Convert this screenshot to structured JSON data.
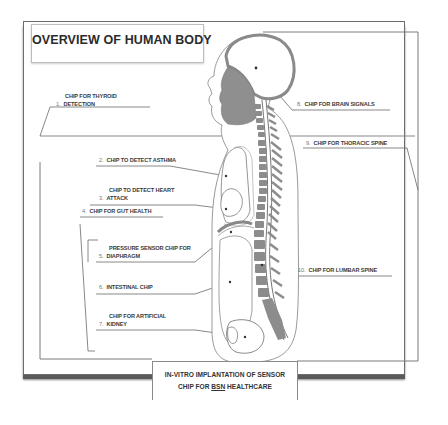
{
  "title": "OVERVIEW OF HUMAN BODY",
  "caption": {
    "line1": "IN-VITRO IMPLANTATION OF SENSOR",
    "line2_prefix": "CHIP FOR ",
    "line2_underlined": "BSN",
    "line2_suffix": " HEALTHCARE"
  },
  "labels": [
    {
      "num": "1.",
      "line1": "CHIP FOR THYROID",
      "line2": "DETECTION"
    },
    {
      "num": "2.",
      "line1": "CHIP TO DETECT ASTHMA"
    },
    {
      "num": "3.",
      "line1": "CHIP TO DETECT HEART",
      "line2": "ATTACK"
    },
    {
      "num": "4.",
      "line1": "CHIP FOR GUT HEALTH"
    },
    {
      "num": "5.",
      "line1": "PRESSURE SENSOR CHIP FOR",
      "line2": "DIAPHRAGM"
    },
    {
      "num": "6.",
      "line1": "INTESTINAL CHIP"
    },
    {
      "num": "7.",
      "line1": "CHIP FOR ARTIFICIAL",
      "line2": "KIDNEY"
    },
    {
      "num": "8.",
      "line1": "CHIP FOR  BRAIN SIGNALS"
    },
    {
      "num": "9.",
      "line1": "CHIP FOR THORACIC SPINE"
    },
    {
      "num": "10.",
      "line1": "CHIP FOR LUMBAR SPINE"
    }
  ],
  "colors": {
    "line": "#6a6a6a",
    "organ_fill": "#8f8f8f",
    "vertebra_fill": "#8c8c8c",
    "text": "#333333"
  }
}
